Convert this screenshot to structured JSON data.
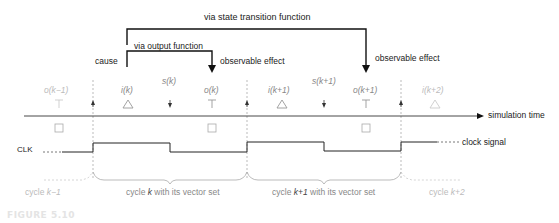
{
  "figure": {
    "label": "FIGURE 5.10"
  },
  "top_labels": {
    "via_state": "via state transition function",
    "via_output": "via output function",
    "cause": "cause",
    "effect_1": "observable effect",
    "effect_2": "observable effect"
  },
  "events": [
    {
      "label": "o(k−1)",
      "symbol": "output-tee",
      "faded": true
    },
    {
      "label": "",
      "symbol": "clock-edge-up"
    },
    {
      "label": "i(k)",
      "symbol": "input-triangle"
    },
    {
      "label": "s(k)",
      "symbol": "state-down"
    },
    {
      "label": "o(k)",
      "symbol": "output-tee"
    },
    {
      "label": "",
      "symbol": "clock-edge-up"
    },
    {
      "label": "i(k+1)",
      "symbol": "input-triangle"
    },
    {
      "label": "s(k+1)",
      "symbol": "state-down"
    },
    {
      "label": "o(k+1)",
      "symbol": "output-tee"
    },
    {
      "label": "",
      "symbol": "clock-edge-up"
    },
    {
      "label": "i(k+2)",
      "symbol": "input-triangle",
      "faded": true
    }
  ],
  "axis": {
    "label": "simulation time"
  },
  "clock": {
    "name": "CLK",
    "label": "clock signal"
  },
  "cycles": [
    {
      "prefix": "cycle ",
      "k": "k−1",
      "suffix": "",
      "faded": true
    },
    {
      "prefix": "cycle ",
      "k": "k",
      "suffix": " with its vector set"
    },
    {
      "prefix": "cycle ",
      "k": "k+1",
      "suffix": " with its vector set"
    },
    {
      "prefix": "cycle ",
      "k": "k+2",
      "suffix": "",
      "faded": true
    }
  ],
  "colors": {
    "line": "#111111",
    "gray": "#888888",
    "light": "#bbbbbb"
  }
}
